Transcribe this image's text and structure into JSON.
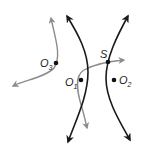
{
  "diagram": {
    "type": "hyperbolas-with-paths",
    "colors": {
      "hyperbola": "#1a1a1a",
      "path": "#8c8c8c",
      "point": "#111111",
      "label": "#222222"
    },
    "points": {
      "S": {
        "label": "S",
        "x": 108,
        "y": 62
      },
      "O1": {
        "label": "O",
        "sub": "1",
        "x": 81,
        "y": 80
      },
      "O2": {
        "label": "O",
        "sub": "2",
        "x": 114,
        "y": 80
      },
      "O3": {
        "label": "O",
        "sub": "3",
        "x": 56,
        "y": 63
      }
    },
    "curves": [
      {
        "name": "hyperbola-left-branch",
        "color": "hyperbola",
        "arrows": "both"
      },
      {
        "name": "hyperbola-right-branch",
        "color": "hyperbola",
        "arrows": "both"
      },
      {
        "name": "gray-path-through-S",
        "color": "path",
        "arrows": "both"
      },
      {
        "name": "gray-path-near-O3",
        "color": "path",
        "arrows": "both"
      }
    ]
  }
}
